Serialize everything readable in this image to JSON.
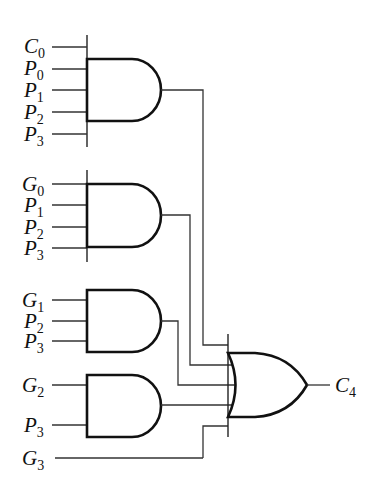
{
  "diagram": {
    "title": "",
    "type": "logic-circuit",
    "output": {
      "symbol": "C",
      "sub": "4"
    },
    "and_gates": [
      {
        "id": "and1",
        "inputs": [
          {
            "symbol": "C",
            "sub": "0"
          },
          {
            "symbol": "P",
            "sub": "0"
          },
          {
            "symbol": "P",
            "sub": "1"
          },
          {
            "symbol": "P",
            "sub": "2"
          },
          {
            "symbol": "P",
            "sub": "3"
          }
        ]
      },
      {
        "id": "and2",
        "inputs": [
          {
            "symbol": "G",
            "sub": "0"
          },
          {
            "symbol": "P",
            "sub": "1"
          },
          {
            "symbol": "P",
            "sub": "2"
          },
          {
            "symbol": "P",
            "sub": "3"
          }
        ]
      },
      {
        "id": "and3",
        "inputs": [
          {
            "symbol": "G",
            "sub": "1"
          },
          {
            "symbol": "P",
            "sub": "2"
          },
          {
            "symbol": "P",
            "sub": "3"
          }
        ]
      },
      {
        "id": "and4",
        "inputs": [
          {
            "symbol": "G",
            "sub": "2"
          },
          {
            "symbol": "P",
            "sub": "3"
          }
        ]
      }
    ],
    "direct_input": {
      "symbol": "G",
      "sub": "3"
    },
    "or_gate": {
      "id": "or1",
      "input_count": 5
    }
  }
}
